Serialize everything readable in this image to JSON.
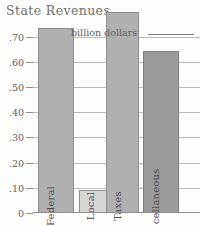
{
  "chart_data": {
    "type": "bar",
    "title": "State Revenues",
    "xlabel": "",
    "ylabel": "",
    "unit_annotation": "billion dollars",
    "ylim": [
      0,
      0.82
    ],
    "grid": true,
    "legend": "none",
    "categories": [
      "Federal",
      "Local",
      "Taxes",
      "Miscellaneous"
    ],
    "values": [
      0.735,
      0.09,
      0.8,
      0.645
    ],
    "ticks": [
      {
        "label": ".70",
        "value": 0.7
      },
      {
        "label": ".60",
        "value": 0.6
      },
      {
        "label": ".50",
        "value": 0.5
      },
      {
        "label": ".40",
        "value": 0.4
      },
      {
        "label": ".30",
        "value": 0.3
      },
      {
        "label": ".20",
        "value": 0.2
      },
      {
        "label": ".10",
        "value": 0.1
      },
      {
        "label": "0",
        "value": 0.0
      }
    ],
    "bars": [
      {
        "label": "Federal",
        "value": 0.735,
        "color": "#b0b0b0",
        "border": "#8e8e8e"
      },
      {
        "label": "Local",
        "value": 0.09,
        "color": "#d6d6d4",
        "border": "#8e8e8e"
      },
      {
        "label": "Taxes",
        "value": 0.8,
        "color": "#b0b0b0",
        "border": "#8e8e8e"
      },
      {
        "label": "Miscellaneous",
        "value": 0.645,
        "color": "#9a9a9a",
        "border": "#7f7f7f"
      }
    ]
  },
  "colors": {
    "background": "#fdfdfc",
    "axis": "#8d8d8d",
    "gridline": "#b9b9b9",
    "title_text": "#6f6f6f",
    "tick_text": "#5d5d5d",
    "bar_label_text": "#4a4a4a"
  }
}
